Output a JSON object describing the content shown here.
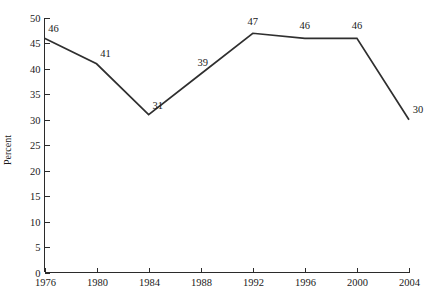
{
  "chart_data": {
    "type": "line",
    "title": "",
    "subtitle": "",
    "xlabel": "",
    "ylabel": "Percent",
    "categories": [
      "1976",
      "1980",
      "1984",
      "1988",
      "1992",
      "1996",
      "2000",
      "2004"
    ],
    "x": [
      1976,
      1980,
      1984,
      1988,
      1992,
      1996,
      2000,
      2004
    ],
    "values": [
      46,
      41,
      31,
      39,
      47,
      46,
      46,
      30
    ],
    "point_labels": [
      "46",
      "41",
      "31",
      "39",
      "47",
      "46",
      "46",
      "30"
    ],
    "xlim": [
      1976,
      2004
    ],
    "ylim": [
      0,
      50
    ],
    "y_ticks": [
      0,
      5,
      10,
      15,
      20,
      25,
      30,
      35,
      40,
      45,
      50
    ],
    "y_tick_labels": [
      "0",
      "5",
      "10",
      "15",
      "20",
      "25",
      "30",
      "35",
      "40",
      "45",
      "50"
    ],
    "x_ticks": [
      1976,
      1980,
      1984,
      1988,
      1992,
      1996,
      2000,
      2004
    ],
    "x_tick_labels": [
      "1976",
      "1980",
      "1984",
      "1988",
      "1992",
      "1996",
      "2000",
      "2004"
    ],
    "grid": false,
    "legend": false,
    "legend_position": "none",
    "series": [
      {
        "name": "Percent",
        "values": [
          46,
          41,
          31,
          39,
          47,
          46,
          46,
          30
        ],
        "color": "#2f2f2f"
      }
    ],
    "colors": {
      "line": "#2f2f2f",
      "axis": "#2b2b2b",
      "text": "#1a1a1a",
      "background": "#ffffff"
    }
  }
}
